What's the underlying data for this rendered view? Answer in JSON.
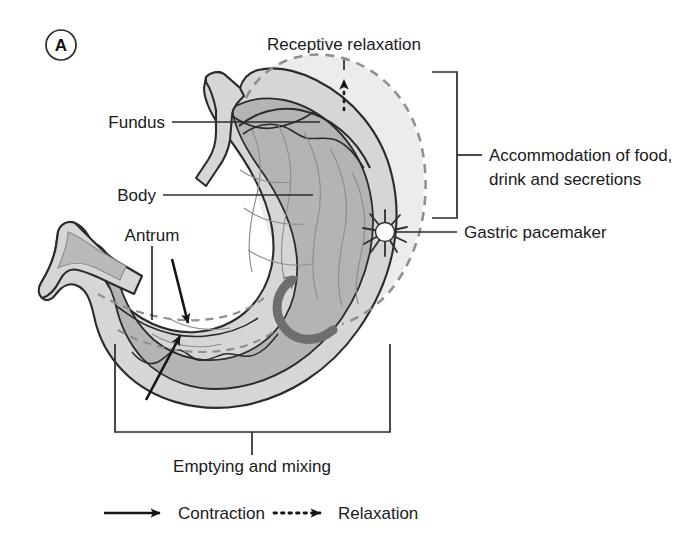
{
  "figure": {
    "panel_label": "A",
    "colors": {
      "outline": "#2b2b2b",
      "wall_fill": "#d6d6d6",
      "lumen_fill": "#b4b4b4",
      "relaxed_fill": "#ececec",
      "dashed_outline": "#8f8f8f",
      "curved_arrow": "#6e6e6e",
      "text": "#1a1a1a",
      "leader_line": "#2b2b2b",
      "background": "#ffffff"
    }
  },
  "labels": {
    "fundus": "Fundus",
    "body": "Body",
    "antrum": "Antrum",
    "receptive_relaxation": "Receptive relaxation",
    "accommodation_line1": "Accommodation of food,",
    "accommodation_line2": "drink and secretions",
    "gastric_pacemaker": "Gastric pacemaker",
    "emptying_and_mixing": "Emptying and mixing"
  },
  "legend": {
    "items": [
      {
        "symbol": "solid-arrow",
        "label": "Contraction"
      },
      {
        "symbol": "dotted-arrow",
        "label": "Relaxation"
      }
    ]
  },
  "annotations": {
    "contraction_arrows": 2,
    "relaxation_arrows": 1,
    "pacemaker_marker": "starburst",
    "peristalsis_arrow": "curved-arrow"
  }
}
